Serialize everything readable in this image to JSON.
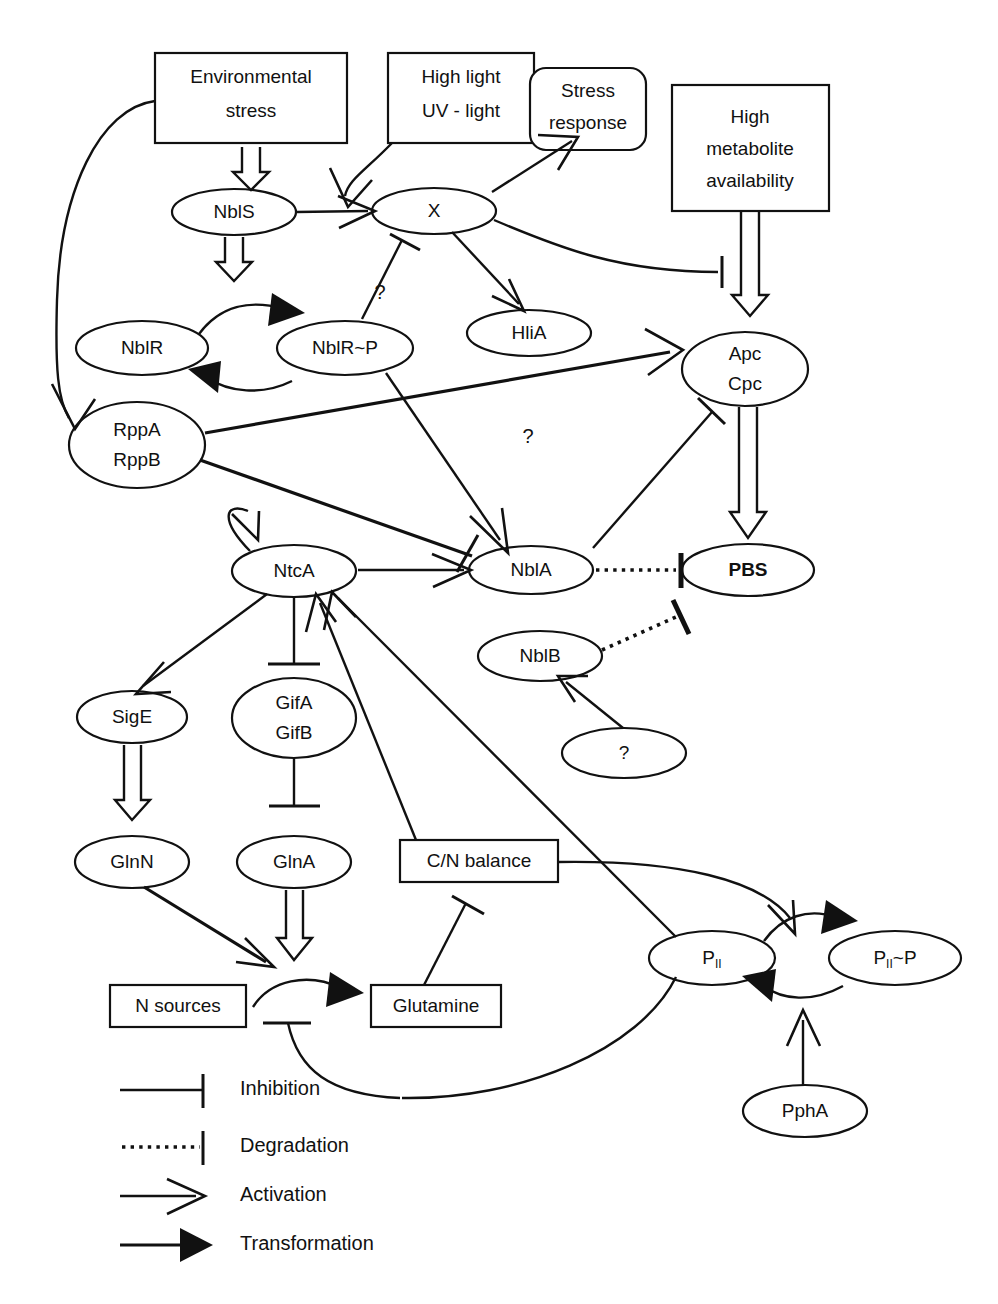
{
  "diagram": {
    "nodes": {
      "environmental_stress": "Environmental\nstress",
      "environmental_stress_l1": "Environmental",
      "environmental_stress_l2": "stress",
      "high_light_l1": "High light",
      "high_light_l2": "UV - light",
      "stress_response_l1": "Stress",
      "stress_response_l2": "response",
      "high_metabolite_l1": "High",
      "high_metabolite_l2": "metabolite",
      "high_metabolite_l3": "availability",
      "nbls": "NblS",
      "x": "X",
      "hlia": "HliA",
      "nblr": "NblR",
      "nblr_p": "NblR~P",
      "rpp_l1": "RppA",
      "rpp_l2": "RppB",
      "apc_l1": "Apc",
      "apc_l2": "Cpc",
      "ntca": "NtcA",
      "nbla": "NblA",
      "pbs": "PBS",
      "nblb": "NblB",
      "unknown_q": "?",
      "sige": "SigE",
      "gif_l1": "GifA",
      "gif_l2": "GifB",
      "glnn": "GlnN",
      "glna": "GlnA",
      "cn_balance": "C/N balance",
      "n_sources": "N sources",
      "glutamine": "Glutamine",
      "pii": "P",
      "pii_sub": "II",
      "pii_p": "P",
      "pii_p_sub": "II",
      "pii_p_tail": "~P",
      "ppha": "PphA"
    },
    "edge_labels": {
      "q_nblrp_x": "?",
      "q_rpp_apc": "?"
    },
    "legend": [
      {
        "key": "inhibition",
        "label": "Inhibition"
      },
      {
        "key": "degradation",
        "label": "Degradation"
      },
      {
        "key": "activation",
        "label": "Activation"
      },
      {
        "key": "transformation",
        "label": "Transformation"
      }
    ],
    "colors": {
      "stroke": "#111111",
      "fill": "#ffffff",
      "background": "#ffffff"
    }
  }
}
